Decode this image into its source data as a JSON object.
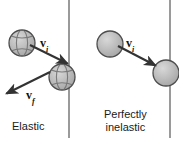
{
  "figure": {
    "width": 179,
    "height": 143,
    "background": "#ffffff"
  },
  "colors": {
    "ball_fill": "#b3b3b3",
    "ball_stroke": "#4d4d4d",
    "ball_highlight": "#d9d9d9",
    "wall_line": "#999999",
    "arrow": "#333333",
    "text": "#1a1a1a"
  },
  "panels": [
    {
      "id": "elastic",
      "caption": "Elastic",
      "wall": {
        "x": 69,
        "y1": 0,
        "y2": 138
      },
      "balls": [
        {
          "name": "incoming-ball",
          "cx": 22,
          "cy": 43,
          "r": 13,
          "pattern": "striped"
        },
        {
          "name": "contact-ball",
          "cx": 62,
          "cy": 77,
          "r": 13,
          "pattern": "striped"
        }
      ],
      "vectors": [
        {
          "name": "initial-velocity-vector",
          "label": "v",
          "subscript": "i",
          "x1": 30,
          "y1": 45,
          "x2": 68,
          "y2": 64
        },
        {
          "name": "final-velocity-vector",
          "label": "v",
          "subscript": "f",
          "x1": 50,
          "y1": 72,
          "x2": 6,
          "y2": 94
        }
      ]
    },
    {
      "id": "perfectly-inelastic",
      "caption_line1": "Perfectly",
      "caption_line2": "inelastic",
      "wall": {
        "x": 170,
        "y1": 0,
        "y2": 138
      },
      "balls": [
        {
          "name": "incoming-ball",
          "cx": 110,
          "cy": 44,
          "r": 13,
          "pattern": "plain"
        },
        {
          "name": "stuck-ball",
          "cx": 166,
          "cy": 73,
          "r": 13,
          "pattern": "plain"
        }
      ],
      "vectors": [
        {
          "name": "initial-velocity-vector",
          "label": "v",
          "subscript": "i",
          "x1": 118,
          "y1": 46,
          "x2": 156,
          "y2": 66
        }
      ]
    }
  ]
}
